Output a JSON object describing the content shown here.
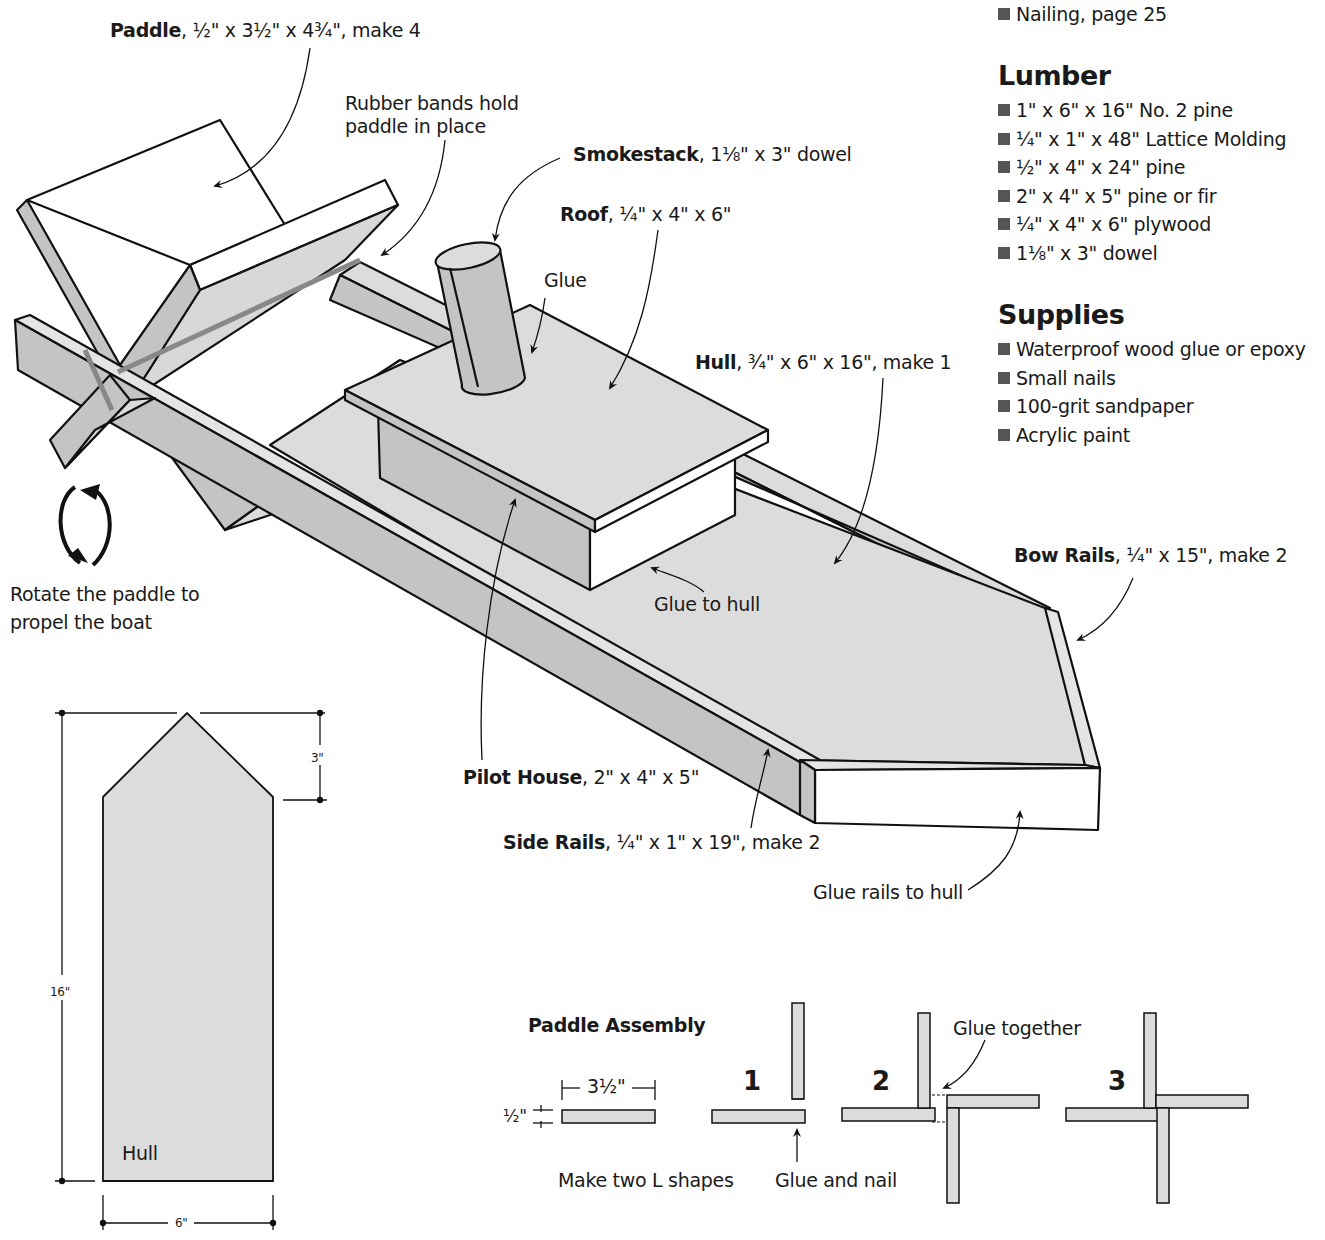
{
  "sidebar": {
    "see_also": [
      "Nailing, page 25"
    ],
    "lumber": {
      "heading": "Lumber",
      "items": [
        "1\" x 6\" x 16\" No. 2 pine",
        "¼\" x 1\" x 48\" Lattice Molding",
        "½\" x 4\" x 24\" pine",
        "2\" x 4\" x 5\" pine or fir",
        "¼\" x 4\" x 6\" plywood",
        "1⅛\" x 3\" dowel"
      ]
    },
    "supplies": {
      "heading": "Supplies",
      "items": [
        "Waterproof wood glue or epoxy",
        "Small nails",
        "100-grit sandpaper",
        "Acrylic paint"
      ]
    }
  },
  "callouts": {
    "paddle": {
      "name": "Paddle",
      "spec": ", ½\" x 3½\" x 4¾\", make 4"
    },
    "rubber_bands": {
      "line1": "Rubber bands hold",
      "line2": "paddle in place"
    },
    "smokestack": {
      "name": "Smokestack",
      "spec": ", 1⅛\" x 3\" dowel"
    },
    "roof": {
      "name": "Roof",
      "spec": ", ¼\" x 4\" x 6\""
    },
    "glue": "Glue",
    "hull": {
      "name": "Hull",
      "spec": ", ¾\" x 6\" x 16\", make 1"
    },
    "bow_rails": {
      "name": "Bow Rails",
      "spec": ", ¼\" x 15\", make 2"
    },
    "glue_to_hull": "Glue to hull",
    "pilot_house": {
      "name": "Pilot House",
      "spec": ", 2\" x 4\" x 5\""
    },
    "side_rails": {
      "name": "Side Rails",
      "spec": ", ¼\" x 1\" x 19\", make 2"
    },
    "glue_rails": "Glue rails to hull",
    "rotate": {
      "line1": "Rotate the paddle to",
      "line2": "propel the boat"
    }
  },
  "hull_plan": {
    "label": "Hull",
    "dim_length": "16\"",
    "dim_point": "3\"",
    "dim_width": "6\""
  },
  "paddle_assembly": {
    "title": "Paddle Assembly",
    "dim_length": "3½\"",
    "dim_thickness": "½\"",
    "steps": [
      "1",
      "2",
      "3"
    ],
    "make_two": "Make two L shapes",
    "glue_and_nail": "Glue and nail",
    "glue_together": "Glue together"
  },
  "colors": {
    "wood_light": "#dcdcdc",
    "wood_mid": "#c4c4c4",
    "wood_dark": "#b0b0b0",
    "outline": "#111111"
  }
}
